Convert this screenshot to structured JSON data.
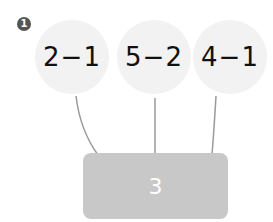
{
  "problem": {
    "number_badge": "1",
    "expressions": [
      "2−1",
      "5−2",
      "4−1"
    ],
    "answer_box": "3"
  },
  "colors": {
    "circle_fill": "#f2f2f2",
    "box_fill": "#c8c8c8",
    "line": "#9a9a9a",
    "badge": "#555555"
  }
}
